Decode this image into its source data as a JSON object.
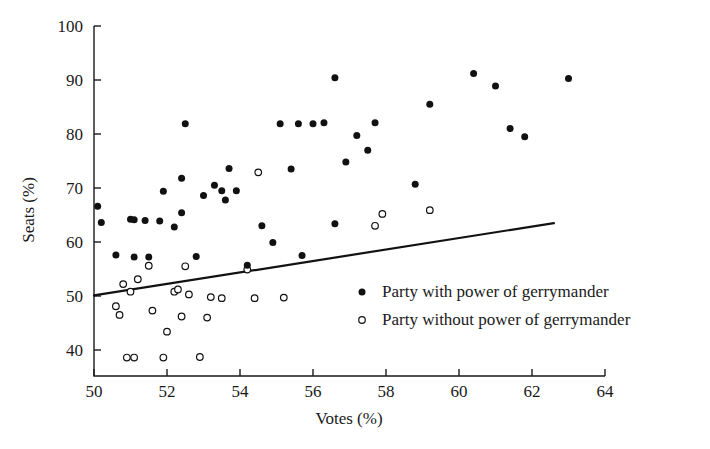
{
  "chart_data": {
    "type": "scatter",
    "title": "",
    "xlabel": "Votes (%)",
    "ylabel": "Seats (%)",
    "xlim": [
      50,
      64
    ],
    "ylim": [
      36.5,
      100
    ],
    "xticks": [
      50,
      52,
      54,
      56,
      58,
      60,
      62,
      64
    ],
    "yticks": [
      40,
      50,
      60,
      70,
      80,
      90,
      100
    ],
    "grid": false,
    "legend_position": "center-right-inside",
    "series": [
      {
        "name": "Party with power of gerrymander",
        "marker": "filled-circle",
        "color": "#111111",
        "points": [
          [
            50.1,
            66.6
          ],
          [
            50.2,
            63.6
          ],
          [
            50.6,
            57.6
          ],
          [
            51.0,
            64.2
          ],
          [
            51.1,
            64.1
          ],
          [
            51.1,
            57.2
          ],
          [
            51.4,
            64.0
          ],
          [
            51.5,
            57.2
          ],
          [
            51.8,
            63.9
          ],
          [
            51.9,
            69.4
          ],
          [
            52.2,
            62.8
          ],
          [
            52.4,
            71.8
          ],
          [
            52.4,
            65.4
          ],
          [
            52.5,
            81.9
          ],
          [
            52.8,
            57.3
          ],
          [
            53.0,
            68.6
          ],
          [
            53.3,
            70.5
          ],
          [
            53.5,
            69.5
          ],
          [
            53.6,
            67.8
          ],
          [
            53.7,
            73.6
          ],
          [
            53.9,
            69.5
          ],
          [
            54.2,
            55.7
          ],
          [
            54.6,
            63.0
          ],
          [
            54.9,
            59.9
          ],
          [
            55.1,
            81.9
          ],
          [
            55.4,
            73.5
          ],
          [
            55.6,
            81.9
          ],
          [
            55.7,
            57.5
          ],
          [
            56.0,
            81.9
          ],
          [
            56.3,
            82.1
          ],
          [
            56.6,
            90.4
          ],
          [
            56.6,
            63.4
          ],
          [
            56.9,
            74.8
          ],
          [
            57.2,
            79.7
          ],
          [
            57.5,
            77.0
          ],
          [
            57.7,
            82.1
          ],
          [
            58.8,
            70.7
          ],
          [
            59.2,
            85.5
          ],
          [
            60.4,
            91.2
          ],
          [
            61.0,
            88.9
          ],
          [
            61.4,
            81.0
          ],
          [
            61.8,
            79.5
          ],
          [
            63.0,
            90.3
          ]
        ]
      },
      {
        "name": "Party without power of gerrymander",
        "marker": "open-circle",
        "color": "#111111",
        "points": [
          [
            50.6,
            48.1
          ],
          [
            50.7,
            46.5
          ],
          [
            50.8,
            52.2
          ],
          [
            50.9,
            38.6
          ],
          [
            51.0,
            50.8
          ],
          [
            51.1,
            38.6
          ],
          [
            51.2,
            53.1
          ],
          [
            51.5,
            55.6
          ],
          [
            51.6,
            47.3
          ],
          [
            51.9,
            38.6
          ],
          [
            52.0,
            43.4
          ],
          [
            52.2,
            50.8
          ],
          [
            52.3,
            51.2
          ],
          [
            52.4,
            46.2
          ],
          [
            52.5,
            55.5
          ],
          [
            52.6,
            50.3
          ],
          [
            52.9,
            38.7
          ],
          [
            53.1,
            46.0
          ],
          [
            53.2,
            49.8
          ],
          [
            53.5,
            49.6
          ],
          [
            54.2,
            54.9
          ],
          [
            54.4,
            49.6
          ],
          [
            54.5,
            72.9
          ],
          [
            55.2,
            49.7
          ],
          [
            57.7,
            63.0
          ],
          [
            57.9,
            65.2
          ],
          [
            59.2,
            65.9
          ]
        ]
      }
    ],
    "fit_line": {
      "name": "proportionality / regression line",
      "x_start": 50.0,
      "y_start": 50.1,
      "x_end": 62.6,
      "y_end": 63.5
    }
  },
  "legend": {
    "entries": [
      {
        "marker": "filled-circle",
        "label": "Party with power of gerrymander"
      },
      {
        "marker": "open-circle",
        "label": "Party without power of gerrymander"
      }
    ]
  }
}
